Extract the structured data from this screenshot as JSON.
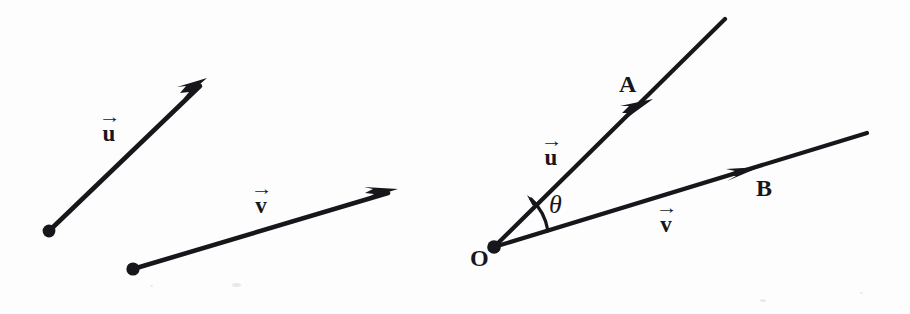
{
  "figure": {
    "background_color": "#fdfdfd",
    "ink_color": "#17161a",
    "panels": [
      {
        "name": "left-panel",
        "caption": "",
        "vectors": [
          {
            "id": "u",
            "label": "u",
            "arrow_accent": "→",
            "label_x": 100,
            "label_y": 112,
            "tail": {
              "x": 49,
              "y": 231
            },
            "head": {
              "x": 206,
              "y": 80
            },
            "has_tail_dot": true,
            "arrowhead_at": "head"
          },
          {
            "id": "v",
            "label": "v",
            "arrow_accent": "→",
            "label_x": 252,
            "label_y": 184,
            "tail": {
              "x": 133,
              "y": 269
            },
            "head": {
              "x": 396,
              "y": 190
            },
            "has_tail_dot": true,
            "arrowhead_at": "head"
          }
        ],
        "points": [],
        "angle": null
      },
      {
        "name": "right-panel",
        "caption": "",
        "vectors": [
          {
            "id": "u",
            "label": "u",
            "arrow_accent": "→",
            "label_x": 542,
            "label_y": 136,
            "tail": {
              "x": 494,
              "y": 247
            },
            "head": {
              "x": 724,
              "y": 20
            },
            "has_tail_dot": true,
            "arrowhead_at": "mid",
            "arrowhead_point": {
              "x": 641,
              "y": 110
            }
          },
          {
            "id": "v",
            "label": "v",
            "arrow_accent": "→",
            "label_x": 657,
            "label_y": 203,
            "tail": {
              "x": 494,
              "y": 247
            },
            "head": {
              "x": 866,
              "y": 134
            },
            "has_tail_dot": true,
            "arrowhead_at": "mid",
            "arrowhead_point": {
              "x": 748,
              "y": 172
            }
          }
        ],
        "points": [
          {
            "id": "O",
            "label": "O",
            "x": 470,
            "y": 246,
            "marker": {
              "x": 494,
              "y": 247
            }
          },
          {
            "id": "A",
            "label": "A",
            "x": 619,
            "y": 72,
            "marker": null
          },
          {
            "id": "B",
            "label": "B",
            "x": 756,
            "y": 176,
            "marker": null
          }
        ],
        "angle": {
          "id": "theta",
          "label": "θ",
          "label_x": 549,
          "label_y": 192,
          "arc_from": {
            "x": 526,
            "y": 224
          },
          "arc_to": {
            "x": 549,
            "y": 208
          },
          "vertex": {
            "x": 494,
            "y": 247
          }
        }
      }
    ]
  }
}
